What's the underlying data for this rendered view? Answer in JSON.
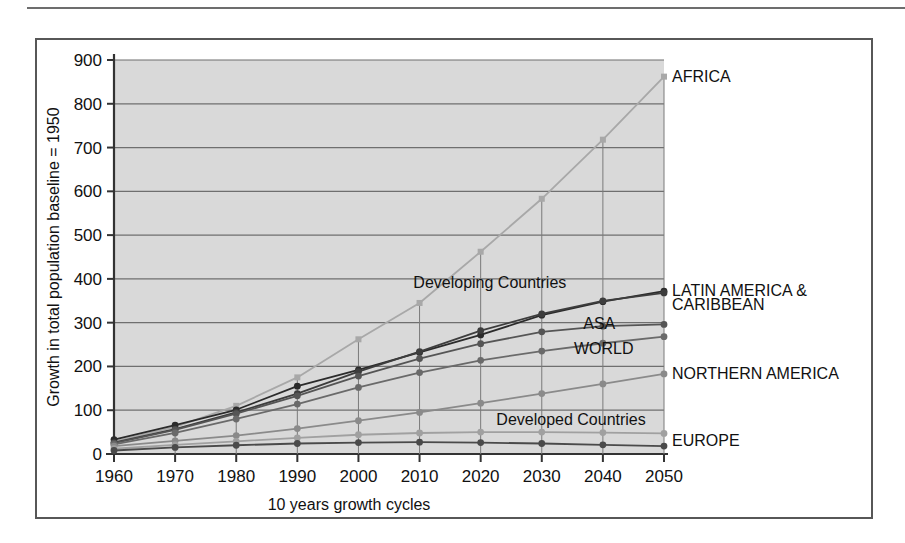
{
  "figure": {
    "frame_border_color": "#575757",
    "plot_background": "#d9d9d9",
    "gridline_color": "#6f6f6f"
  },
  "chart_data": {
    "type": "line",
    "title": "",
    "xlabel": "10 years growth cycles",
    "ylabel": "Growth in total population baseline = 1950",
    "x": [
      1960,
      1970,
      1980,
      1990,
      2000,
      2010,
      2020,
      2030,
      2040,
      2050
    ],
    "categories": [
      "1960",
      "1970",
      "1980",
      "1990",
      "2000",
      "2010",
      "2020",
      "2030",
      "2040",
      "2050"
    ],
    "xlim": [
      1960,
      2050
    ],
    "ylim": [
      0,
      900
    ],
    "yticks": [
      0,
      100,
      200,
      300,
      400,
      500,
      600,
      700,
      800,
      900
    ],
    "ytick_labels": [
      "0",
      "100",
      "200",
      "300",
      "400",
      "500",
      "600",
      "700",
      "800",
      "900"
    ],
    "grid": true,
    "legend_position": "inline-right-of-line-ends",
    "series": [
      {
        "name": "AFRICA",
        "label": "AFRICA",
        "color": "#a8a8a8",
        "marker": "square",
        "values": [
          28,
          62,
          110,
          175,
          262,
          345,
          462,
          583,
          718,
          862
        ]
      },
      {
        "name": "LATIN AMERICA & CARIBBEAN",
        "label": "LATIN AMERICA & CARIBBEAN",
        "color": "#2b2b2b",
        "marker": "circle",
        "values": [
          33,
          66,
          101,
          155,
          192,
          232,
          272,
          317,
          348,
          372
        ]
      },
      {
        "name": "Developing Countries",
        "label": "Developing Countries",
        "color": "#3d3d3d",
        "marker": "circle",
        "values": [
          26,
          57,
          95,
          138,
          188,
          234,
          282,
          320,
          350,
          368
        ]
      },
      {
        "name": "ASA",
        "label": "ASA",
        "color": "#555555",
        "marker": "circle",
        "values": [
          25,
          55,
          92,
          133,
          178,
          218,
          252,
          279,
          292,
          296
        ]
      },
      {
        "name": "WORLD",
        "label": "WORLD",
        "color": "#6a6a6a",
        "marker": "circle",
        "values": [
          22,
          48,
          80,
          114,
          152,
          186,
          214,
          235,
          253,
          268
        ]
      },
      {
        "name": "NORTHERN AMERICA",
        "label": "NORTHERN AMERICA",
        "color": "#8a8a8a",
        "marker": "circle",
        "values": [
          18,
          30,
          42,
          58,
          76,
          95,
          116,
          138,
          160,
          183
        ]
      },
      {
        "name": "Developed Countries",
        "label": "Developed Countries",
        "color": "#a0a0a0",
        "marker": "circle",
        "values": [
          12,
          21,
          29,
          37,
          44,
          48,
          50,
          50,
          49,
          47
        ]
      },
      {
        "name": "EUROPE",
        "label": "EUROPE",
        "color": "#4a4a4a",
        "marker": "circle",
        "values": [
          8,
          15,
          20,
          24,
          26,
          27,
          26,
          24,
          21,
          18
        ]
      }
    ],
    "annotations": [
      {
        "text": "AFRICA",
        "x": 2050,
        "y": 862,
        "anchor": "start"
      },
      {
        "text": "LATIN AMERICA &",
        "x": 2050,
        "y": 372,
        "anchor": "start"
      },
      {
        "text": "CARIBBEAN",
        "x": 2050,
        "y": 340,
        "anchor": "start"
      },
      {
        "text": "Developing Countries",
        "x": 2035,
        "y": 390,
        "anchor": "end"
      },
      {
        "text": "ASA",
        "x": 2043,
        "y": 296,
        "anchor": "end"
      },
      {
        "text": "WORLD",
        "x": 2046,
        "y": 240,
        "anchor": "end"
      },
      {
        "text": "NORTHERN AMERICA",
        "x": 2050,
        "y": 183,
        "anchor": "start"
      },
      {
        "text": "Developed Countries",
        "x": 2048,
        "y": 78,
        "anchor": "end"
      },
      {
        "text": "EUROPE",
        "x": 2050,
        "y": 30,
        "anchor": "start"
      }
    ]
  }
}
